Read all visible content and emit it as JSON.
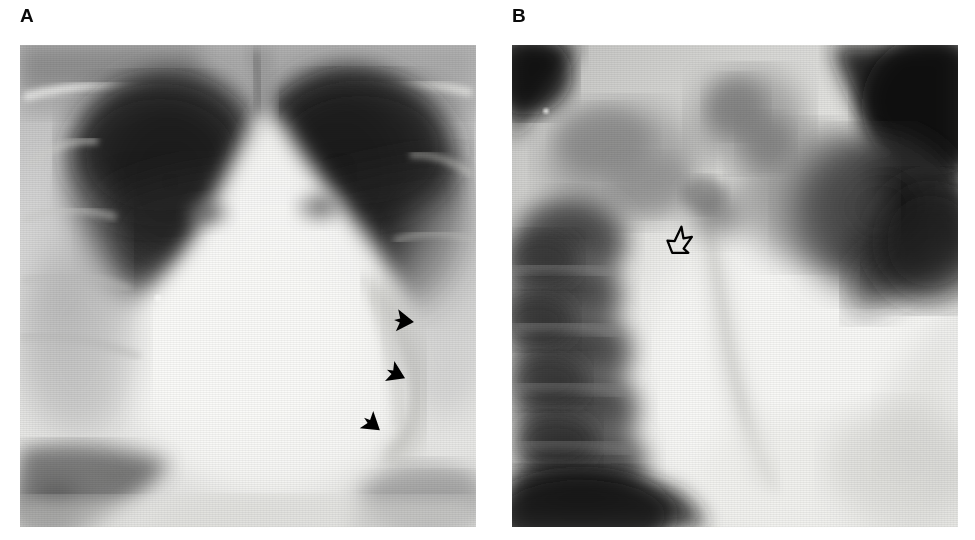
{
  "figure": {
    "type": "radiograph-figure",
    "background_color": "#ffffff",
    "width": 975,
    "height": 540,
    "panel_count": 2
  },
  "panels": [
    {
      "id": "panel-a",
      "label": "A",
      "label_color": "#0a0a0a",
      "modality": "chest-radiograph",
      "view": "frontal-pa",
      "x": 20,
      "y": 45,
      "width": 456,
      "height": 482,
      "description_alt": "Frontal chest radiograph showing lung fields and cardiac silhouette",
      "markers": [
        {
          "name": "solid-arrowhead-1",
          "style": "solid",
          "x": 404,
          "y": 321,
          "rotation": 186,
          "size": 24
        },
        {
          "name": "solid-arrowhead-2",
          "style": "solid",
          "x": 396,
          "y": 374,
          "rotation": 205,
          "size": 24
        },
        {
          "name": "solid-arrowhead-3",
          "style": "solid",
          "x": 372,
          "y": 424,
          "rotation": 218,
          "size": 24
        }
      ]
    },
    {
      "id": "panel-b",
      "label": "B",
      "label_color": "#0a0a0a",
      "modality": "chest-radiograph",
      "view": "lateral-coned",
      "x": 512,
      "y": 45,
      "width": 446,
      "height": 482,
      "description_alt": "Coned lateral chest radiograph showing vertebral bodies and retrocardiac region",
      "markers": [
        {
          "name": "open-arrowhead-1",
          "style": "open",
          "x": 681,
          "y": 242,
          "rotation": 330,
          "size": 30
        }
      ]
    }
  ],
  "colors": {
    "film_white": "#f3f3f1",
    "film_light": "#dedede",
    "film_mid": "#9a9a9a",
    "film_dark": "#3a3a3a",
    "film_black": "#101010",
    "marker_black": "#000000",
    "page_background": "#ffffff"
  }
}
